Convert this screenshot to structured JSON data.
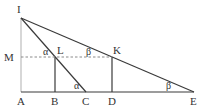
{
  "diagram": {
    "type": "geometry",
    "colors": {
      "line": "#3a3a3a",
      "axis": "#bdbdbd",
      "dashed": "#8a8a8a",
      "text": "#333333"
    },
    "points": {
      "I": {
        "label": "I",
        "x": 21,
        "y": 18
      },
      "A": {
        "label": "A",
        "x": 21,
        "y": 92
      },
      "M": {
        "label": "M",
        "x": 21,
        "y": 57
      },
      "L": {
        "label": "L",
        "x": 55,
        "y": 57
      },
      "B": {
        "label": "B",
        "x": 55,
        "y": 92
      },
      "C": {
        "label": "C",
        "x": 86,
        "y": 92
      },
      "K": {
        "label": "K",
        "x": 112,
        "y": 57
      },
      "D": {
        "label": "D",
        "x": 112,
        "y": 92
      },
      "E": {
        "label": "E",
        "x": 194,
        "y": 92
      }
    },
    "angles": {
      "alpha_at_L": "α",
      "alpha_at_C": "α",
      "beta_on_dashed": "β",
      "beta_at_E": "β"
    }
  }
}
